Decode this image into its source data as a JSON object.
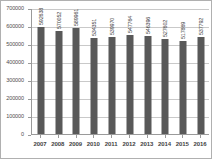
{
  "chart_data": {
    "type": "bar",
    "title": "",
    "subtitle": "",
    "xlabel": "",
    "ylabel": "",
    "categories": [
      "2007",
      "2008",
      "2009",
      "2010",
      "2011",
      "2012",
      "2013",
      "2014",
      "2015",
      "2016"
    ],
    "values": [
      592638,
      570052,
      589961,
      534351,
      539970,
      547764,
      546396,
      527602,
      517869,
      537792
    ],
    "data_labels": [
      "592638",
      "570052",
      "589961",
      "534351",
      "539970",
      "547764",
      "546396",
      "527602",
      "517869",
      "537792"
    ],
    "ylim": [
      0,
      700000
    ],
    "ytick_labels": [
      "0",
      "100000",
      "200000",
      "300000",
      "400000",
      "500000",
      "600000",
      "700000"
    ],
    "ytick_values": [
      0,
      100000,
      200000,
      300000,
      400000,
      500000,
      600000,
      700000
    ],
    "grid": true,
    "legend": false,
    "legend_position": "none",
    "series": [
      {
        "name": "",
        "values": [
          592638,
          570052,
          589961,
          534351,
          539970,
          547764,
          546396,
          527602,
          517869,
          537792
        ],
        "color": "#595959"
      }
    ],
    "colors": {
      "bar": "#595959",
      "gridline": "#c9c9c9",
      "axis": "#9a9a9a",
      "frame": "#b0b0b0",
      "text": "#3f3f3f",
      "background": "#ffffff"
    }
  }
}
